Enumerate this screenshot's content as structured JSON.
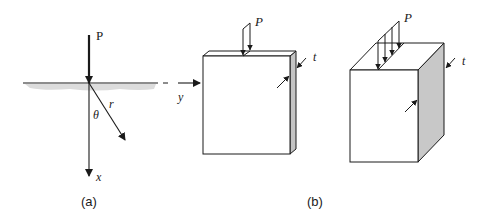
{
  "figure": {
    "panel_a": {
      "caption": "(a)",
      "load_label": "P",
      "axis_x_label": "x",
      "axis_y_label": "y",
      "radius_label": "r",
      "angle_label": "θ"
    },
    "panel_b": {
      "caption": "(b)",
      "thin_plate": {
        "load_label": "P",
        "thickness_label": "t"
      },
      "thick_block": {
        "load_label": "P",
        "thickness_label": "t"
      }
    },
    "colors": {
      "stroke": "#1a1a1a",
      "side_face": "#c8c8c8",
      "ground_shade": "#d9d9d9"
    }
  }
}
